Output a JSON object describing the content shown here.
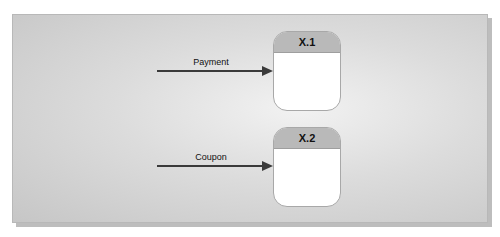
{
  "diagram": {
    "type": "data-flow-diagram",
    "processes": [
      {
        "id": "X.1",
        "label": "X.1"
      },
      {
        "id": "X.2",
        "label": "X.2"
      }
    ],
    "flows": [
      {
        "label": "Payment",
        "to": "X.1"
      },
      {
        "label": "Coupon",
        "to": "X.2"
      }
    ]
  }
}
